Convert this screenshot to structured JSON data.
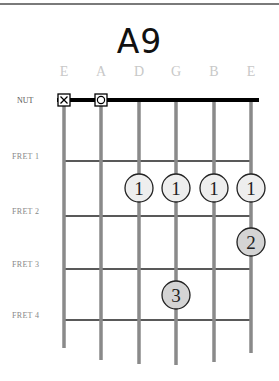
{
  "chord": {
    "name": "A9"
  },
  "strings": [
    {
      "label": "E",
      "x": 64,
      "end_y": 348,
      "marker": "muted"
    },
    {
      "label": "A",
      "x": 101,
      "end_y": 360,
      "marker": "open"
    },
    {
      "label": "D",
      "x": 139,
      "end_y": 364,
      "marker": ""
    },
    {
      "label": "G",
      "x": 176,
      "end_y": 365,
      "marker": ""
    },
    {
      "label": "B",
      "x": 214,
      "end_y": 362,
      "marker": ""
    },
    {
      "label": "E",
      "x": 251,
      "end_y": 353,
      "marker": ""
    }
  ],
  "nut": {
    "label": "NUT",
    "y": 100
  },
  "frets": [
    {
      "label": "FRET 1",
      "y": 161
    },
    {
      "label": "FRET 2",
      "y": 216
    },
    {
      "label": "FRET 3",
      "y": 269
    },
    {
      "label": "FRET 4",
      "y": 320
    }
  ],
  "fingers": [
    {
      "string": "D",
      "fret": 1,
      "finger": "1",
      "x": 139,
      "y": 188,
      "fill": "#eeeeee"
    },
    {
      "string": "G",
      "fret": 1,
      "finger": "1",
      "x": 176,
      "y": 188,
      "fill": "#eeeeee"
    },
    {
      "string": "B",
      "fret": 1,
      "finger": "1",
      "x": 214,
      "y": 188,
      "fill": "#eeeeee"
    },
    {
      "string": "E",
      "fret": 1,
      "finger": "1",
      "x": 251,
      "y": 188,
      "fill": "#eeeeee"
    },
    {
      "string": "E",
      "fret": 2,
      "finger": "2",
      "x": 251,
      "y": 242,
      "fill": "#d4d4d4"
    },
    {
      "string": "G",
      "fret": 3,
      "finger": "3",
      "x": 176,
      "y": 295,
      "fill": "#d4d4d4"
    }
  ],
  "markers": {
    "muted": "X",
    "open": "O"
  },
  "colors": {
    "string": "#8a8a8a",
    "fret": "#222222",
    "nut": "#000000",
    "label": "#c8c8c8"
  }
}
